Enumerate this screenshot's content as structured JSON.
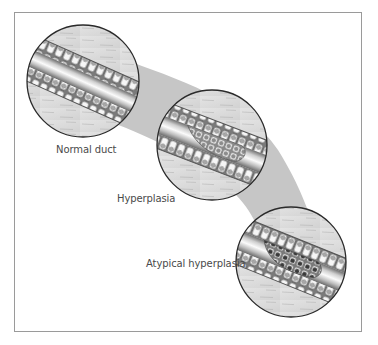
{
  "figure": {
    "type": "progression-diagram",
    "stages": [
      {
        "id": "normal",
        "label": "Normal duct",
        "circle": {
          "cx": 83,
          "cy": 81,
          "r": 56
        },
        "duct_angle": 24,
        "proliferation": "none"
      },
      {
        "id": "hyperplasia",
        "label": "Hyperplasia",
        "circle": {
          "cx": 212,
          "cy": 145,
          "r": 55
        },
        "duct_angle": 21,
        "proliferation": "regular"
      },
      {
        "id": "atypical",
        "label": "Atypical hyperplasia",
        "circle": {
          "cx": 291,
          "cy": 262,
          "r": 55
        },
        "duct_angle": 22,
        "proliferation": "atypical"
      }
    ],
    "colors": {
      "band": "#c6c6c6",
      "frame": "#9a9a9a",
      "circle_outline": "#2a2a2a",
      "stroma": "#dcdcdc",
      "lumen_light": "#f4f4f4",
      "lumen_dark": "#8a8a8a",
      "cell_fill": "#f6f6f6",
      "cell_outline": "#555555",
      "nucleus_normal": "#9a9a9a",
      "nucleus_atypical": "#3a3a3a",
      "text": "#4a4a4a"
    }
  }
}
